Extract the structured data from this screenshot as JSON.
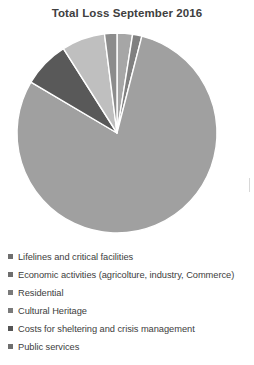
{
  "chart": {
    "title": "Total Loss September 2016"
  },
  "chart_data": {
    "type": "pie",
    "title": "Total Loss September 2016",
    "xlabel": "",
    "ylabel": "",
    "grid": false,
    "legend_position": "bottom",
    "categories": [
      "Lifelines and critical facilities",
      "Economic activities (agricolture, industry, Commerce)",
      "Residential",
      "Cultural Heritage",
      "Costs for sheltering and crisis management",
      "Public services"
    ],
    "values": [
      2.5,
      1.5,
      79.5,
      7.5,
      7.0,
      2.0
    ],
    "units": "percent",
    "colors": [
      "#a6a6a6",
      "#808080",
      "#a0a0a0",
      "#595959",
      "#bfbfbf",
      "#8c8c8c"
    ],
    "slices": [
      {
        "label": "Lifelines and critical facilities",
        "value": 2.5,
        "color": "#a6a6a6",
        "start_angle": 0,
        "end_angle": 9
      },
      {
        "label": "Economic activities (agricolture, industry, Commerce)",
        "value": 1.5,
        "color": "#808080",
        "start_angle": 9,
        "end_angle": 14.4
      },
      {
        "label": "Residential",
        "value": 79.5,
        "color": "#a0a0a0",
        "start_angle": 14.4,
        "end_angle": 300.6
      },
      {
        "label": "Cultural Heritage",
        "value": 7.5,
        "color": "#595959",
        "start_angle": 300.6,
        "end_angle": 327.6
      },
      {
        "label": "Costs for sheltering and crisis management",
        "value": 7.0,
        "color": "#bfbfbf",
        "start_angle": 327.6,
        "end_angle": 352.8
      },
      {
        "label": "Public services",
        "value": 2.0,
        "color": "#8c8c8c",
        "start_angle": 352.8,
        "end_angle": 360
      }
    ]
  },
  "legend": {
    "items": [
      {
        "label": "Lifelines and critical facilities",
        "color": "#6e6e6e"
      },
      {
        "label": "Economic activities (agricolture, industry, Commerce)",
        "color": "#6e6e6e"
      },
      {
        "label": "Residential",
        "color": "#7a7a7a"
      },
      {
        "label": "Cultural Heritage",
        "color": "#7a7a7a"
      },
      {
        "label": "Costs for sheltering and crisis management",
        "color": "#555555"
      },
      {
        "label": "Public services",
        "color": "#6e6e6e"
      }
    ]
  }
}
